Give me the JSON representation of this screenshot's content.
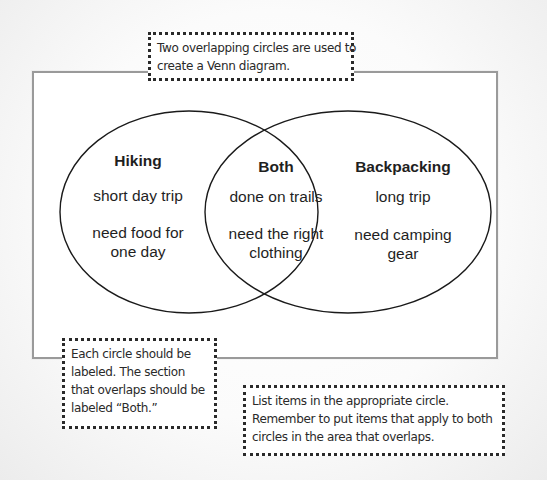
{
  "diagram": {
    "type": "venn",
    "colors": {
      "frame_border": "#9a9a9a",
      "circle_stroke": "#1a1a1a",
      "text": "#1f1f1f",
      "callout_border": "#2a2a2a"
    },
    "left_circle": {
      "title": "Hiking",
      "items": [
        {
          "lines": [
            "short day trip"
          ]
        },
        {
          "lines": [
            "need food for",
            "one day"
          ]
        }
      ]
    },
    "overlap": {
      "title": "Both",
      "items": [
        {
          "lines": [
            "done on trails"
          ]
        },
        {
          "lines": [
            "need the right",
            "clothing"
          ]
        }
      ]
    },
    "right_circle": {
      "title": "Backpacking",
      "items": [
        {
          "lines": [
            "long trip"
          ]
        },
        {
          "lines": [
            "need camping",
            "gear"
          ]
        }
      ]
    }
  },
  "callouts": {
    "top": {
      "lines": [
        "Two overlapping circles are used to",
        "create a Venn diagram."
      ]
    },
    "bottom_left": {
      "lines": [
        "Each circle should be",
        "labeled. The section",
        "that overlaps should be",
        "labeled “Both.”"
      ]
    },
    "bottom_right": {
      "lines": [
        "List items in the appropriate circle.",
        "Remember to put items that apply to both",
        "circles in the area that overlaps."
      ]
    }
  }
}
